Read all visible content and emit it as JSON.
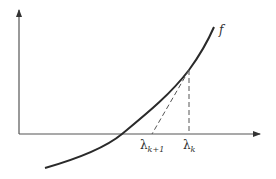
{
  "figure": {
    "curve_label": "f",
    "points": {
      "lambda_k": {
        "base": "λ",
        "sub": "k"
      },
      "lambda_k1": {
        "base": "λ",
        "sub": "k+1"
      }
    },
    "colors": {
      "curve": "#2a2a2a",
      "axes": "#555555",
      "dashed": "#555555",
      "text": "#333333"
    }
  }
}
